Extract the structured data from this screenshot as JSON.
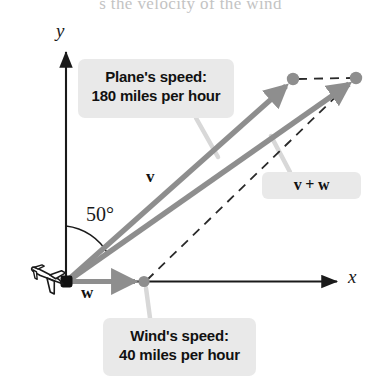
{
  "figure": {
    "cutoff_caption": "s the velocity of the wind",
    "axes": {
      "x_label": "x",
      "y_label": "y",
      "origin": [
        66,
        281
      ]
    },
    "angle": {
      "value": "50°",
      "degrees": 50,
      "from": "positive y-axis",
      "to": "vector v"
    },
    "vectors": [
      {
        "name": "v",
        "label": "v",
        "description": "Plane's velocity vector",
        "color": "#8e8e8e",
        "start": [
          66,
          281
        ],
        "end": [
          292,
          80
        ]
      },
      {
        "name": "v+w",
        "label": "v + w",
        "description": "Resultant velocity vector",
        "color": "#8e8e8e",
        "start": [
          66,
          281
        ],
        "end": [
          355,
          79
        ]
      },
      {
        "name": "w",
        "label": "w",
        "description": "Wind's velocity vector along positive x-axis",
        "color": "#8e8e8e",
        "start": [
          66,
          281
        ],
        "end": [
          144,
          282
        ]
      }
    ],
    "callouts": [
      {
        "id": "plane-speed",
        "line1": "Plane's speed:",
        "line2": "180 miles per hour",
        "points_to": "vector v"
      },
      {
        "id": "wind-speed",
        "line1": "Wind's speed:",
        "line2": "40 miles per hour",
        "points_to": "vector w endpoint"
      },
      {
        "id": "resultant",
        "line1": "v + w",
        "line2": "",
        "points_to": "resultant vector"
      }
    ],
    "dashed_lines": [
      {
        "from": [
          292,
          80
        ],
        "to": [
          355,
          78
        ],
        "note": "top parallelogram side"
      },
      {
        "from": [
          144,
          282
        ],
        "to": [
          355,
          78
        ],
        "note": "side parallel to v"
      }
    ],
    "icon": {
      "name": "airplane-icon",
      "position": [
        45,
        300
      ],
      "heading": "down-left"
    },
    "colors": {
      "vector_gray": "#8e8e8e",
      "callout_bg": "#e9e9e9",
      "axis_black": "#1a1a1a",
      "dot_gray": "#8e8e8e",
      "leader_gray": "#d2d2d2"
    }
  }
}
